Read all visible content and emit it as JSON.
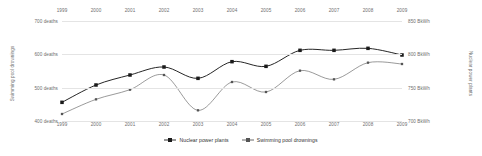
{
  "chart_data": {
    "type": "line",
    "title": "",
    "x": [
      1999,
      2000,
      2001,
      2002,
      2003,
      2004,
      2005,
      2006,
      2007,
      2008,
      2009
    ],
    "xlabel": "",
    "xtick_labels": [
      "1999",
      "2000",
      "2001",
      "2002",
      "2003",
      "2004",
      "2005",
      "2006",
      "2007",
      "2008",
      "2009"
    ],
    "grid": true,
    "legend_position": "bottom-center",
    "axes": [
      {
        "id": "left",
        "side": "left",
        "label": "Swimming pool drownings",
        "unit": "deaths",
        "ylim": [
          400,
          700
        ],
        "ticks": [
          400,
          500,
          600,
          700
        ],
        "tick_labels": [
          "400 deaths",
          "500 deaths",
          "600 deaths",
          "700 deaths"
        ]
      },
      {
        "id": "right",
        "side": "right",
        "label": "Nuclear power plants",
        "unit": "BkWh",
        "ylim": [
          700,
          850
        ],
        "ticks": [
          700,
          750,
          800,
          850
        ],
        "tick_labels": [
          "700 BkWh",
          "750 BkWh",
          "800 BkWh",
          "850 BkWh"
        ]
      }
    ],
    "series": [
      {
        "name": "Nuclear power plants",
        "axis": "right",
        "unit": "BkWh",
        "marker": "square-filled",
        "color": "#1a1a1a",
        "values": [
          728,
          754,
          769,
          781,
          764,
          789,
          782,
          806,
          806,
          809,
          799
        ]
      },
      {
        "name": "Swimming pool drownings",
        "axis": "left",
        "unit": "deaths",
        "marker": "square-small",
        "color": "#555555",
        "values": [
          421,
          465,
          494,
          538,
          432,
          517,
          487,
          551,
          525,
          575,
          571
        ]
      }
    ]
  },
  "legend": {
    "entries": [
      {
        "label": "Nuclear power plants"
      },
      {
        "label": "Swimming pool drownings"
      }
    ]
  },
  "axis_titles": {
    "left": "Swimming pool drownings",
    "right": "Nuclear power plants"
  }
}
